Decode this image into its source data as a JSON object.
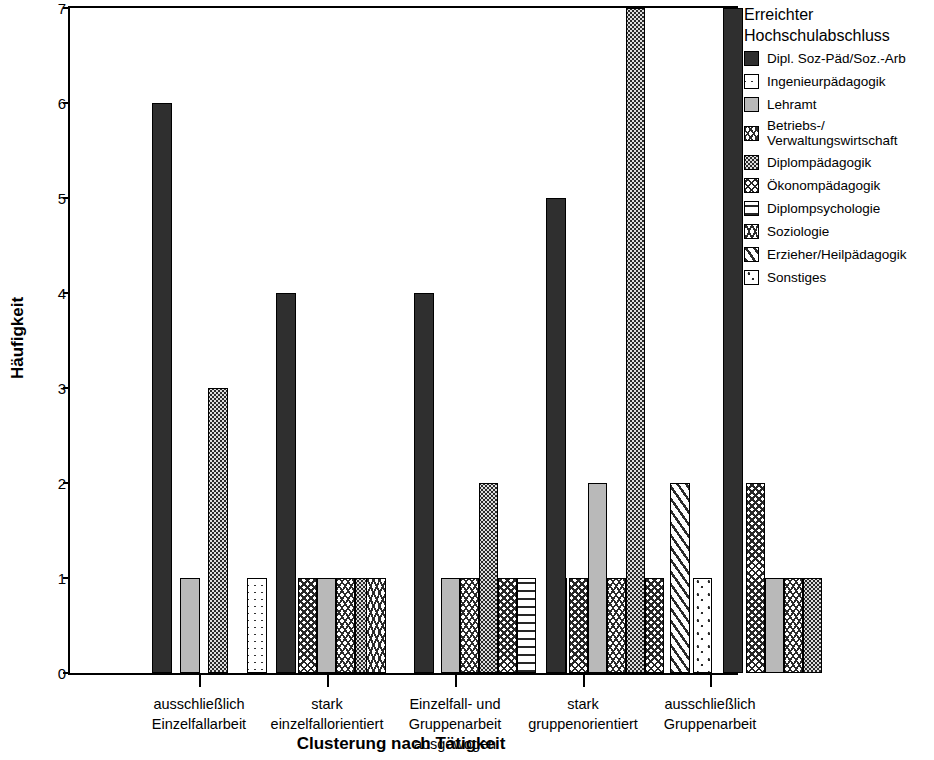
{
  "axes": {
    "ylabel": "Häufigkeit",
    "xlabel": "Clusterung nach Tätigkeit",
    "yticks": [
      "0",
      "1",
      "2",
      "3",
      "4",
      "5",
      "6",
      "7"
    ],
    "ylim": [
      0,
      7
    ]
  },
  "legend": {
    "title": "Erreichter\nHochschulabschluss",
    "entries": [
      {
        "label": "Dipl. Soz-Päd/Soz.-Arb",
        "pattern": "p-solid-dark",
        "key": "dipl_soz_paed"
      },
      {
        "label": "Ingenieurpädagogik",
        "pattern": "p-ingenieur",
        "key": "ingenieurpaedagogik"
      },
      {
        "label": "Lehramt",
        "pattern": "p-lehramt",
        "key": "lehramt"
      },
      {
        "label": "Betriebs-/\nVerwaltungswirtschaft",
        "pattern": "p-betriebs",
        "key": "betriebs_verwaltung"
      },
      {
        "label": "Diplompädagogik",
        "pattern": "p-diplompaed",
        "key": "diplompaedagogik"
      },
      {
        "label": "Ökonompädagogik",
        "pattern": "p-oekonom",
        "key": "oekonompaedagogik"
      },
      {
        "label": "Diplompsychologie",
        "pattern": "p-diplompsych",
        "key": "diplompsychologie"
      },
      {
        "label": "Soziologie",
        "pattern": "p-soziologie",
        "key": "soziologie"
      },
      {
        "label": "Erzieher/Heilpädagogik",
        "pattern": "p-erzieher",
        "key": "erzieher_heilpaedagogik"
      },
      {
        "label": "Sonstiges",
        "pattern": "p-sonstiges",
        "key": "sonstiges"
      }
    ]
  },
  "chart_data": {
    "type": "bar",
    "title": "",
    "xlabel": "Clusterung nach Tätigkeit",
    "ylabel": "Häufigkeit",
    "ylim": [
      0,
      7
    ],
    "grid": false,
    "legend_position": "right",
    "legend_title": "Erreichter Hochschulabschluss",
    "categories": [
      "ausschließlich\nEinzelfallarbeit",
      "stark\neinzelfallorientiert",
      "Einzelfall- und\nGruppenarbeit\nausgewogen",
      "stark\ngruppenorientiert",
      "ausschließlich\nGruppenarbeit"
    ],
    "series": [
      {
        "name": "Dipl. Soz-Päd/Soz.-Arb",
        "values": [
          6,
          4,
          4,
          5,
          7
        ]
      },
      {
        "name": "Ingenieurpädagogik",
        "values": [
          0,
          1,
          0,
          0,
          0
        ]
      },
      {
        "name": "Lehramt",
        "values": [
          1,
          1,
          1,
          2,
          1
        ]
      },
      {
        "name": "Betriebs-/Verwaltungswirtschaft",
        "values": [
          0,
          1,
          1,
          1,
          1
        ]
      },
      {
        "name": "Diplompädagogik",
        "values": [
          3,
          1,
          2,
          7,
          1
        ]
      },
      {
        "name": "Ökonompädagogik",
        "values": [
          0,
          1,
          1,
          1,
          2
        ]
      },
      {
        "name": "Diplompsychologie",
        "values": [
          0,
          0,
          1,
          0,
          0
        ]
      },
      {
        "name": "Soziologie",
        "values": [
          0,
          1,
          0,
          0,
          0
        ]
      },
      {
        "name": "Erzieher/Heilpädagogik",
        "values": [
          0,
          0,
          1,
          2,
          0
        ]
      },
      {
        "name": "Sonstiges",
        "values": [
          0,
          0,
          0,
          1,
          0
        ]
      }
    ]
  },
  "bars": [
    {
      "group": 0,
      "key": "dipl_soz_paed",
      "pattern": "p-solid-dark",
      "value": 6,
      "x": 82,
      "w": 20
    },
    {
      "group": 0,
      "key": "lehramt",
      "pattern": "p-lehramt",
      "value": 1,
      "x": 110,
      "w": 20
    },
    {
      "group": 0,
      "key": "diplompaedagogik",
      "pattern": "p-diplompaed",
      "value": 3,
      "x": 138,
      "w": 20
    },
    {
      "group": 1,
      "key": "ingenieurpaedagogik",
      "pattern": "p-ingenieur",
      "value": 1,
      "x": 177,
      "w": 20
    },
    {
      "group": 1,
      "key": "dipl_soz_paed",
      "pattern": "p-solid-dark",
      "value": 4,
      "x": 206,
      "w": 20
    },
    {
      "group": 1,
      "key": "oekonompaedagogik",
      "pattern": "p-oekonom",
      "value": 1,
      "x": 228,
      "w": 19
    },
    {
      "group": 1,
      "key": "lehramt",
      "pattern": "p-lehramt",
      "value": 1,
      "x": 247,
      "w": 19
    },
    {
      "group": 1,
      "key": "betriebs_verwaltung",
      "pattern": "p-betriebs",
      "value": 1,
      "x": 266,
      "w": 19
    },
    {
      "group": 1,
      "key": "diplompaedagogik",
      "pattern": "p-diplompaed",
      "value": 1,
      "x": 285,
      "w": 19
    },
    {
      "group": 1,
      "key": "soziologie",
      "pattern": "p-soziologie",
      "value": 1,
      "x": 296,
      "w": 20
    },
    {
      "group": 2,
      "key": "dipl_soz_paed",
      "pattern": "p-solid-dark",
      "value": 4,
      "x": 344,
      "w": 20
    },
    {
      "group": 2,
      "key": "lehramt",
      "pattern": "p-lehramt",
      "value": 1,
      "x": 371,
      "w": 19
    },
    {
      "group": 2,
      "key": "betriebs_verwaltung",
      "pattern": "p-betriebs",
      "value": 1,
      "x": 390,
      "w": 19
    },
    {
      "group": 2,
      "key": "diplompaedagogik",
      "pattern": "p-diplompaed",
      "value": 2,
      "x": 409,
      "w": 19
    },
    {
      "group": 2,
      "key": "oekonompaedagogik",
      "pattern": "p-oekonom",
      "value": 1,
      "x": 428,
      "w": 19
    },
    {
      "group": 2,
      "key": "diplompsychologie",
      "pattern": "p-diplompsych",
      "value": 1,
      "x": 447,
      "w": 19
    },
    {
      "group": 2,
      "key": "erzieher_heilpaedagogik",
      "pattern": "p-erzieher",
      "value": 1,
      "x": 477,
      "w": 20
    },
    {
      "group": 3,
      "key": "dipl_soz_paed",
      "pattern": "p-solid-dark",
      "value": 5,
      "x": 476,
      "w": 20
    },
    {
      "group": 3,
      "key": "oekonompaedagogik",
      "pattern": "p-oekonom",
      "value": 1,
      "x": 499,
      "w": 19
    },
    {
      "group": 3,
      "key": "lehramt",
      "pattern": "p-lehramt",
      "value": 2,
      "x": 518,
      "w": 19
    },
    {
      "group": 3,
      "key": "betriebs_verwaltung",
      "pattern": "p-betriebs",
      "value": 1,
      "x": 537,
      "w": 19
    },
    {
      "group": 3,
      "key": "diplompaedagogik",
      "pattern": "p-diplompaed",
      "value": 7,
      "x": 556,
      "w": 19
    },
    {
      "group": 3,
      "key": "oekonompaedagogik2",
      "pattern": "p-oekonom",
      "value": 1,
      "x": 575,
      "w": 19
    },
    {
      "group": 3,
      "key": "erzieher_heilpaedagogik",
      "pattern": "p-erzieher",
      "value": 2,
      "x": 600,
      "w": 20
    },
    {
      "group": 3,
      "key": "sonstiges",
      "pattern": "p-sonstiges",
      "value": 1,
      "x": 623,
      "w": 19
    },
    {
      "group": 4,
      "key": "dipl_soz_paed",
      "pattern": "p-solid-dark",
      "value": 7,
      "x": 653,
      "w": 20
    },
    {
      "group": 4,
      "key": "oekonompaedagogik",
      "pattern": "p-oekonom",
      "value": 2,
      "x": 676,
      "w": 19
    },
    {
      "group": 4,
      "key": "lehramt",
      "pattern": "p-lehramt",
      "value": 1,
      "x": 695,
      "w": 19
    },
    {
      "group": 4,
      "key": "betriebs_verwaltung",
      "pattern": "p-betriebs",
      "value": 1,
      "x": 714,
      "w": 19
    },
    {
      "group": 4,
      "key": "diplompaedagogik",
      "pattern": "p-diplompaed",
      "value": 1,
      "x": 733,
      "w": 19
    }
  ],
  "xticks": [
    129,
    257,
    385,
    513,
    640
  ]
}
